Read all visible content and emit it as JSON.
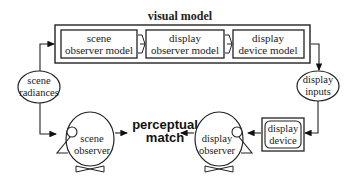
{
  "diagram": {
    "visual_model": {
      "title": "visual model",
      "boxes": [
        {
          "line1": "scene",
          "line2": "observer model"
        },
        {
          "line1": "display",
          "line2": "observer model"
        },
        {
          "line1": "display",
          "line2": "device model"
        }
      ]
    },
    "scene_radiances": {
      "line1": "scene",
      "line2": "radiances"
    },
    "display_inputs": {
      "line1": "display",
      "line2": "inputs"
    },
    "display_device": {
      "line1": "display",
      "line2": "device"
    },
    "scene_observer": {
      "line1": "scene",
      "line2": "observer"
    },
    "display_observer": {
      "line1": "display",
      "line2": "observer"
    },
    "perceptual_match": {
      "line1": "perceptual",
      "line2": "match"
    }
  }
}
